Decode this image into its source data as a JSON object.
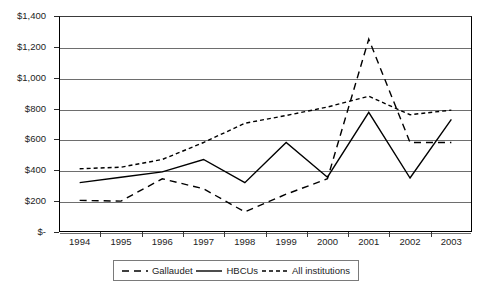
{
  "chart_data": {
    "type": "line",
    "title": "",
    "xlabel": "",
    "ylabel": "",
    "categories": [
      "1994",
      "1995",
      "1996",
      "1997",
      "1998",
      "1999",
      "2000",
      "2001",
      "2002",
      "2003"
    ],
    "ylim": [
      0,
      1400
    ],
    "ytick_labels": [
      "$1,400",
      "$1,200",
      "$1,000",
      "$800",
      "$600",
      "$400",
      "$200",
      "$-"
    ],
    "ytick_values": [
      1400,
      1200,
      1000,
      800,
      600,
      400,
      200,
      0
    ],
    "grid": true,
    "legend_position": "bottom",
    "series": [
      {
        "name": "Gallaudet",
        "style": "dashed",
        "color": "#000000",
        "values": [
          205,
          200,
          345,
          280,
          130,
          245,
          345,
          1250,
          580,
          580
        ]
      },
      {
        "name": "HBCUs",
        "style": "solid",
        "color": "#000000",
        "values": [
          320,
          355,
          390,
          470,
          320,
          580,
          355,
          775,
          350,
          730
        ]
      },
      {
        "name": "All institutions",
        "style": "dotted",
        "color": "#000000",
        "values": [
          410,
          420,
          470,
          580,
          705,
          755,
          810,
          880,
          760,
          790
        ]
      }
    ]
  },
  "legend": {
    "entries": [
      {
        "label": "Gallaudet",
        "swatch": "dashed-line-swatch"
      },
      {
        "label": "HBCUs",
        "swatch": "solid-line-swatch"
      },
      {
        "label": "All institutions",
        "swatch": "dotted-line-swatch"
      }
    ]
  }
}
